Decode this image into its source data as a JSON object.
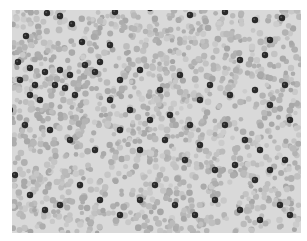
{
  "image": {
    "description": "Grayscale micrograph of a blood smear: dense light-gray red blood cells with scattered dark stained cells",
    "background": "#ffffff",
    "field_color": "#d9d9d9",
    "rbc_color": "#b8b8b8",
    "dark_cell_color": "#2a2a2a",
    "dark_cells": [
      [
        47,
        13
      ],
      [
        60,
        16
      ],
      [
        115,
        12
      ],
      [
        72,
        24
      ],
      [
        26,
        36
      ],
      [
        82,
        42
      ],
      [
        110,
        45
      ],
      [
        150,
        8
      ],
      [
        190,
        15
      ],
      [
        225,
        12
      ],
      [
        255,
        20
      ],
      [
        282,
        18
      ],
      [
        270,
        40
      ],
      [
        265,
        55
      ],
      [
        240,
        60
      ],
      [
        18,
        62
      ],
      [
        30,
        68
      ],
      [
        45,
        72
      ],
      [
        60,
        70
      ],
      [
        70,
        75
      ],
      [
        85,
        65
      ],
      [
        100,
        62
      ],
      [
        95,
        72
      ],
      [
        20,
        80
      ],
      [
        35,
        85
      ],
      [
        55,
        85
      ],
      [
        65,
        88
      ],
      [
        75,
        95
      ],
      [
        40,
        100
      ],
      [
        30,
        95
      ],
      [
        120,
        80
      ],
      [
        140,
        70
      ],
      [
        160,
        90
      ],
      [
        180,
        75
      ],
      [
        200,
        100
      ],
      [
        210,
        85
      ],
      [
        230,
        95
      ],
      [
        255,
        90
      ],
      [
        270,
        105
      ],
      [
        285,
        85
      ],
      [
        290,
        120
      ],
      [
        245,
        140
      ],
      [
        260,
        150
      ],
      [
        10,
        110
      ],
      [
        25,
        125
      ],
      [
        50,
        130
      ],
      [
        70,
        140
      ],
      [
        95,
        150
      ],
      [
        120,
        130
      ],
      [
        140,
        150
      ],
      [
        165,
        140
      ],
      [
        185,
        160
      ],
      [
        200,
        145
      ],
      [
        215,
        170
      ],
      [
        235,
        165
      ],
      [
        255,
        180
      ],
      [
        270,
        170
      ],
      [
        285,
        160
      ],
      [
        15,
        175
      ],
      [
        30,
        195
      ],
      [
        45,
        210
      ],
      [
        60,
        205
      ],
      [
        80,
        185
      ],
      [
        100,
        200
      ],
      [
        120,
        215
      ],
      [
        140,
        200
      ],
      [
        155,
        185
      ],
      [
        175,
        205
      ],
      [
        195,
        215
      ],
      [
        215,
        200
      ],
      [
        240,
        210
      ],
      [
        260,
        220
      ],
      [
        280,
        205
      ],
      [
        290,
        215
      ],
      [
        110,
        100
      ],
      [
        130,
        110
      ],
      [
        150,
        120
      ],
      [
        170,
        115
      ],
      [
        190,
        125
      ],
      [
        225,
        125
      ]
    ]
  }
}
